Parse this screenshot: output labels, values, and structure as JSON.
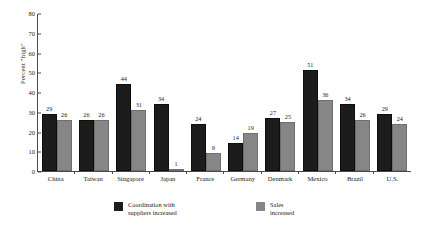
{
  "chart_data": {
    "type": "bar",
    "title": "",
    "xlabel": "",
    "ylabel": "Percent \"high\"",
    "ylim": [
      0,
      80
    ],
    "yticks": [
      0,
      10,
      20,
      30,
      40,
      50,
      60,
      70,
      80
    ],
    "grid": false,
    "legend_position": "bottom",
    "categories": [
      "China",
      "Taiwan",
      "Singapore",
      "Japan",
      "France",
      "Germany",
      "Denmark",
      "Mexico",
      "Brazil",
      "U.S."
    ],
    "series": [
      {
        "name": "Coordination with suppliers increased",
        "color": "#1c1c1c",
        "values": [
          29,
          26,
          44,
          34,
          24,
          14,
          27,
          51,
          34,
          29
        ]
      },
      {
        "name": "Sales increased",
        "color": "#868686",
        "values": [
          26,
          26,
          31,
          1,
          9,
          19,
          25,
          36,
          26,
          24
        ]
      }
    ]
  },
  "legend": {
    "items": [
      {
        "swatch": "dark",
        "line1": "Coordination with",
        "line2": "suppliers increased"
      },
      {
        "swatch": "gray",
        "line1": "Sales",
        "line2": "increased"
      }
    ]
  }
}
